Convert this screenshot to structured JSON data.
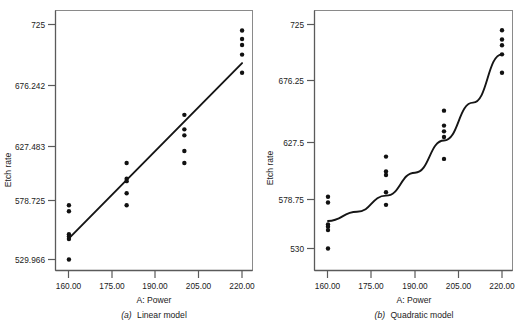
{
  "figure": {
    "title": "",
    "panels": [
      {
        "id": "a",
        "caption_label": "(a)",
        "caption_text": "Linear model",
        "caption_full": "(a) Linear model",
        "xlabel": "A: Power",
        "ylabel": "Etch rate",
        "x_ticks": [
          "160.00",
          "175.00",
          "190.00",
          "205.00",
          "220.00"
        ],
        "y_ticks": [
          "529.966",
          "578.725",
          "627.483",
          "676.242",
          "725"
        ]
      },
      {
        "id": "b",
        "caption_label": "(b)",
        "caption_text": "Quadratic model",
        "caption_full": "(b) Quadratic model",
        "xlabel": "A: Power",
        "ylabel": "Etch rate",
        "x_ticks": [
          "160.00",
          "175.00",
          "190.00",
          "205.00",
          "220.00"
        ],
        "y_ticks": [
          "530",
          "578.75",
          "627.5",
          "676.25",
          "725"
        ]
      }
    ]
  },
  "colors": {
    "ink": "#1a1a1a",
    "axis": "#555555",
    "frame": "#8a8a8a",
    "marker": "#111111",
    "background": "#ffffff"
  },
  "chart_data": [
    {
      "type": "scatter",
      "title": "(a) Linear model",
      "xlabel": "A: Power",
      "ylabel": "Etch rate",
      "xlim": [
        155.0,
        225.0
      ],
      "ylim": [
        529.966,
        725.0
      ],
      "xticks": [
        160.0,
        175.0,
        190.0,
        205.0,
        220.0
      ],
      "yticks": [
        529.966,
        578.725,
        627.483,
        676.242,
        725.0
      ],
      "grid": false,
      "legend": "none",
      "points": [
        {
          "x": 160,
          "y": 575
        },
        {
          "x": 160,
          "y": 570
        },
        {
          "x": 160,
          "y": 551
        },
        {
          "x": 160,
          "y": 549
        },
        {
          "x": 160,
          "y": 547
        },
        {
          "x": 160,
          "y": 530
        },
        {
          "x": 180,
          "y": 610
        },
        {
          "x": 180,
          "y": 597
        },
        {
          "x": 180,
          "y": 595
        },
        {
          "x": 180,
          "y": 585
        },
        {
          "x": 180,
          "y": 575
        },
        {
          "x": 200,
          "y": 650
        },
        {
          "x": 200,
          "y": 638
        },
        {
          "x": 200,
          "y": 633
        },
        {
          "x": 200,
          "y": 620
        },
        {
          "x": 200,
          "y": 610
        },
        {
          "x": 220,
          "y": 720
        },
        {
          "x": 220,
          "y": 713
        },
        {
          "x": 220,
          "y": 708
        },
        {
          "x": 220,
          "y": 700
        },
        {
          "x": 220,
          "y": 685
        }
      ],
      "fit": {
        "kind": "line",
        "label": "Linear model fit",
        "x": [
          160,
          220
        ],
        "y": [
          547.5,
          693.0
        ]
      }
    },
    {
      "type": "scatter",
      "title": "(b) Quadratic model",
      "xlabel": "A: Power",
      "ylabel": "Etch rate",
      "xlim": [
        155.0,
        225.0
      ],
      "ylim": [
        530.0,
        725.0
      ],
      "xticks": [
        160.0,
        175.0,
        190.0,
        205.0,
        220.0
      ],
      "yticks": [
        530.0,
        578.75,
        627.5,
        676.25,
        725.0
      ],
      "grid": false,
      "legend": "none",
      "points": [
        {
          "x": 160,
          "y": 575
        },
        {
          "x": 160,
          "y": 570
        },
        {
          "x": 160,
          "y": 551
        },
        {
          "x": 160,
          "y": 549
        },
        {
          "x": 160,
          "y": 546
        },
        {
          "x": 160,
          "y": 530
        },
        {
          "x": 180,
          "y": 610
        },
        {
          "x": 180,
          "y": 597
        },
        {
          "x": 180,
          "y": 594
        },
        {
          "x": 180,
          "y": 579
        },
        {
          "x": 180,
          "y": 568
        },
        {
          "x": 200,
          "y": 650
        },
        {
          "x": 200,
          "y": 637
        },
        {
          "x": 200,
          "y": 632
        },
        {
          "x": 200,
          "y": 627
        },
        {
          "x": 200,
          "y": 608
        },
        {
          "x": 220,
          "y": 720
        },
        {
          "x": 220,
          "y": 712
        },
        {
          "x": 220,
          "y": 707
        },
        {
          "x": 220,
          "y": 699
        },
        {
          "x": 220,
          "y": 683
        }
      ],
      "fit": {
        "kind": "quadratic",
        "label": "Quadratic model fit",
        "x": [
          160,
          170,
          180,
          190,
          200,
          210,
          220
        ],
        "y": [
          554.0,
          562.0,
          576.0,
          596.0,
          624.0,
          657.0,
          699.0
        ]
      }
    }
  ]
}
